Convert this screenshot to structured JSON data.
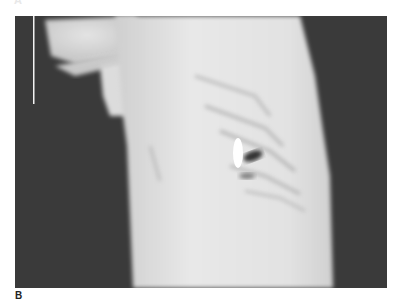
{
  "figure": {
    "panel_labels": [
      "A",
      "B"
    ],
    "image_description": "Lateral chest radiograph with an oval radiopaque foreign body projecting over the mid lung field",
    "colors": {
      "background": "#ffffff",
      "film_dark": "#3b3b3b",
      "body_light": "#e6e6e6",
      "foreign_body": "#ffffff"
    }
  }
}
